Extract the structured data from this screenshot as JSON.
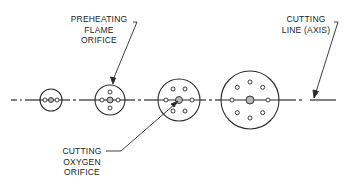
{
  "labels": {
    "preheating_flame_orifice": [
      "PREHEATING",
      "FLAME",
      "ORIFICE"
    ],
    "cutting_oxygen_orifice": [
      "CUTTING",
      "OXYGEN",
      "ORIFICE"
    ],
    "cutting_line": [
      "CUTTING",
      "LINE (AXIS)"
    ]
  },
  "tips": [
    {
      "name": "tip-size-1",
      "cx": 51,
      "cy": 100,
      "r": 11,
      "center_orifice_r": 2.5,
      "preheat_orifices": [
        [
          -6,
          0
        ],
        [
          6,
          0
        ]
      ]
    },
    {
      "name": "tip-size-2",
      "cx": 110,
      "cy": 100,
      "r": 15,
      "center_orifice_r": 3,
      "preheat_orifices": [
        [
          -8,
          0
        ],
        [
          8,
          0
        ],
        [
          0,
          -8
        ],
        [
          0,
          8
        ]
      ]
    },
    {
      "name": "tip-size-3",
      "cx": 179,
      "cy": 100,
      "r": 21,
      "center_orifice_r": 3.5,
      "preheat_orifices": [
        [
          -13,
          0
        ],
        [
          13,
          0
        ],
        [
          -6,
          -11
        ],
        [
          6,
          -11
        ],
        [
          -6,
          11
        ],
        [
          6,
          11
        ]
      ]
    },
    {
      "name": "tip-size-4",
      "cx": 250,
      "cy": 100,
      "r": 29,
      "center_orifice_r": 4,
      "preheat_orifices": [
        [
          -18,
          0
        ],
        [
          18,
          0
        ],
        [
          0,
          -18
        ],
        [
          0,
          18
        ],
        [
          -12.7,
          -12.7
        ],
        [
          12.7,
          -12.7
        ],
        [
          -12.7,
          12.7
        ],
        [
          12.7,
          12.7
        ]
      ]
    }
  ],
  "colors": {
    "line": "#2a2a2a",
    "center_fill": "#b8b8b8",
    "background": "#ffffff"
  }
}
